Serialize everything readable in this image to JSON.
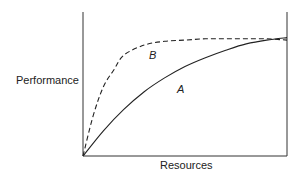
{
  "chart_data": {
    "type": "line",
    "title": "",
    "xlabel": "Resources",
    "ylabel": "Performance",
    "grid": false,
    "legend": "none (curves labeled inline)",
    "axis_ticks": "none",
    "series": [
      {
        "name": "A",
        "style": "solid",
        "x": [
          0,
          0.1,
          0.2,
          0.3,
          0.4,
          0.5,
          0.6,
          0.7,
          0.8,
          0.9,
          1.0
        ],
        "values": [
          0,
          0.2,
          0.37,
          0.51,
          0.62,
          0.71,
          0.78,
          0.84,
          0.89,
          0.92,
          0.94
        ]
      },
      {
        "name": "B",
        "style": "dashed",
        "x": [
          0,
          0.05,
          0.1,
          0.15,
          0.2,
          0.3,
          0.4,
          0.5,
          0.6,
          0.7,
          0.8,
          0.9,
          1.0
        ],
        "values": [
          0,
          0.32,
          0.55,
          0.68,
          0.8,
          0.88,
          0.91,
          0.92,
          0.93,
          0.93,
          0.93,
          0.93,
          0.92
        ]
      }
    ],
    "xlim": [
      0,
      1
    ],
    "ylim": [
      0,
      1
    ]
  },
  "labels": {
    "y_axis": "Performance",
    "x_axis": "Resources",
    "curve_a": "A",
    "curve_b": "B"
  }
}
